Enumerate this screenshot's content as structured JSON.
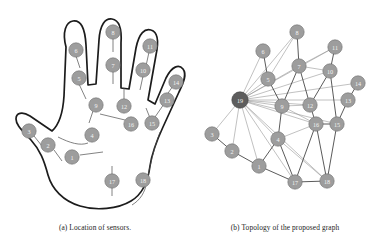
{
  "figure": {
    "background_color": "#ffffff",
    "node_color": "#9d9d9d",
    "hub_color": "#5d5d5d",
    "edge_color": "#8e8e8e",
    "edge_strong_color": "#3c3c3c",
    "outline_color": "#1c1c1c"
  },
  "panel_a": {
    "caption": "(a) Location of sensors.",
    "node_labels": {
      "n1": "1",
      "n2": "2",
      "n3": "3",
      "n4": "4",
      "n5": "5",
      "n6": "6",
      "n7": "7",
      "n8": "8",
      "n9": "9",
      "n10": "10",
      "n11": "11",
      "n12": "12",
      "n13": "13",
      "n14": "14",
      "n15": "15",
      "n16": "16",
      "n17": "17",
      "n18": "18"
    },
    "nodes": [
      {
        "id": "1",
        "label": "1",
        "x": 72,
        "y": 157
      },
      {
        "id": "2",
        "label": "2",
        "x": 48,
        "y": 145
      },
      {
        "id": "3",
        "label": "3",
        "x": 29,
        "y": 131
      },
      {
        "id": "4",
        "label": "4",
        "x": 92,
        "y": 135
      },
      {
        "id": "5",
        "label": "5",
        "x": 79,
        "y": 78
      },
      {
        "id": "6",
        "label": "6",
        "x": 76,
        "y": 50
      },
      {
        "id": "7",
        "label": "7",
        "x": 113,
        "y": 65
      },
      {
        "id": "8",
        "label": "8",
        "x": 113,
        "y": 32
      },
      {
        "id": "9",
        "label": "9",
        "x": 96,
        "y": 105
      },
      {
        "id": "10",
        "label": "10",
        "x": 143,
        "y": 70
      },
      {
        "id": "11",
        "label": "11",
        "x": 150,
        "y": 46
      },
      {
        "id": "12",
        "label": "12",
        "x": 124,
        "y": 106
      },
      {
        "id": "13",
        "label": "13",
        "x": 167,
        "y": 100
      },
      {
        "id": "14",
        "label": "14",
        "x": 176,
        "y": 82
      },
      {
        "id": "15",
        "label": "15",
        "x": 152,
        "y": 123
      },
      {
        "id": "16",
        "label": "16",
        "x": 131,
        "y": 124
      },
      {
        "id": "17",
        "label": "17",
        "x": 112,
        "y": 181
      },
      {
        "id": "18",
        "label": "18",
        "x": 143,
        "y": 180
      }
    ]
  },
  "panel_b": {
    "caption": "(b) Topology of the proposed graph",
    "hub_id": "19",
    "node_labels": {
      "n1": "1",
      "n2": "2",
      "n3": "3",
      "n4": "4",
      "n5": "5",
      "n6": "6",
      "n7": "7",
      "n8": "8",
      "n9": "9",
      "n10": "10",
      "n11": "11",
      "n12": "12",
      "n13": "13",
      "n14": "14",
      "n15": "15",
      "n16": "16",
      "n17": "17",
      "n18": "18",
      "n19": "19"
    },
    "nodes": [
      {
        "id": "19",
        "label": "19",
        "x": 240,
        "y": 100,
        "hub": true
      },
      {
        "id": "1",
        "label": "1",
        "x": 259,
        "y": 166
      },
      {
        "id": "2",
        "label": "2",
        "x": 232,
        "y": 151
      },
      {
        "id": "3",
        "label": "3",
        "x": 212,
        "y": 134
      },
      {
        "id": "4",
        "label": "4",
        "x": 278,
        "y": 139
      },
      {
        "id": "5",
        "label": "5",
        "x": 268,
        "y": 79
      },
      {
        "id": "6",
        "label": "6",
        "x": 263,
        "y": 51
      },
      {
        "id": "7",
        "label": "7",
        "x": 299,
        "y": 66
      },
      {
        "id": "8",
        "label": "8",
        "x": 297,
        "y": 32
      },
      {
        "id": "9",
        "label": "9",
        "x": 282,
        "y": 106
      },
      {
        "id": "10",
        "label": "10",
        "x": 330,
        "y": 71
      },
      {
        "id": "11",
        "label": "11",
        "x": 335,
        "y": 47
      },
      {
        "id": "12",
        "label": "12",
        "x": 310,
        "y": 105
      },
      {
        "id": "13",
        "label": "13",
        "x": 348,
        "y": 100
      },
      {
        "id": "14",
        "label": "14",
        "x": 358,
        "y": 83
      },
      {
        "id": "15",
        "label": "15",
        "x": 337,
        "y": 124
      },
      {
        "id": "16",
        "label": "16",
        "x": 316,
        "y": 124
      },
      {
        "id": "17",
        "label": "17",
        "x": 295,
        "y": 182
      },
      {
        "id": "18",
        "label": "18",
        "x": 327,
        "y": 181
      }
    ],
    "edges": [
      {
        "from": "19",
        "to": "1",
        "strong": false
      },
      {
        "from": "19",
        "to": "2",
        "strong": false
      },
      {
        "from": "19",
        "to": "3",
        "strong": false
      },
      {
        "from": "19",
        "to": "4",
        "strong": false
      },
      {
        "from": "19",
        "to": "5",
        "strong": false
      },
      {
        "from": "19",
        "to": "6",
        "strong": false
      },
      {
        "from": "19",
        "to": "7",
        "strong": false
      },
      {
        "from": "19",
        "to": "8",
        "strong": false
      },
      {
        "from": "19",
        "to": "9",
        "strong": false
      },
      {
        "from": "19",
        "to": "10",
        "strong": false
      },
      {
        "from": "19",
        "to": "11",
        "strong": false
      },
      {
        "from": "19",
        "to": "12",
        "strong": false
      },
      {
        "from": "19",
        "to": "13",
        "strong": false
      },
      {
        "from": "19",
        "to": "14",
        "strong": false
      },
      {
        "from": "19",
        "to": "15",
        "strong": false
      },
      {
        "from": "19",
        "to": "16",
        "strong": false
      },
      {
        "from": "19",
        "to": "17",
        "strong": false
      },
      {
        "from": "19",
        "to": "18",
        "strong": false
      },
      {
        "from": "3",
        "to": "2",
        "strong": true
      },
      {
        "from": "2",
        "to": "1",
        "strong": true
      },
      {
        "from": "1",
        "to": "4",
        "strong": true
      },
      {
        "from": "1",
        "to": "17",
        "strong": true
      },
      {
        "from": "4",
        "to": "9",
        "strong": true
      },
      {
        "from": "4",
        "to": "17",
        "strong": true
      },
      {
        "from": "4",
        "to": "16",
        "strong": false
      },
      {
        "from": "4",
        "to": "18",
        "strong": false
      },
      {
        "from": "9",
        "to": "5",
        "strong": true
      },
      {
        "from": "9",
        "to": "7",
        "strong": true
      },
      {
        "from": "9",
        "to": "12",
        "strong": false
      },
      {
        "from": "9",
        "to": "16",
        "strong": false
      },
      {
        "from": "5",
        "to": "6",
        "strong": true
      },
      {
        "from": "5",
        "to": "8",
        "strong": false
      },
      {
        "from": "7",
        "to": "8",
        "strong": true
      },
      {
        "from": "7",
        "to": "11",
        "strong": false
      },
      {
        "from": "7",
        "to": "12",
        "strong": true
      },
      {
        "from": "7",
        "to": "10",
        "strong": false
      },
      {
        "from": "10",
        "to": "11",
        "strong": true
      },
      {
        "from": "10",
        "to": "12",
        "strong": true
      },
      {
        "from": "10",
        "to": "15",
        "strong": true
      },
      {
        "from": "12",
        "to": "16",
        "strong": true
      },
      {
        "from": "13",
        "to": "14",
        "strong": true
      },
      {
        "from": "13",
        "to": "15",
        "strong": true
      },
      {
        "from": "15",
        "to": "16",
        "strong": true
      },
      {
        "from": "15",
        "to": "18",
        "strong": true
      },
      {
        "from": "16",
        "to": "17",
        "strong": true
      },
      {
        "from": "16",
        "to": "18",
        "strong": true
      },
      {
        "from": "17",
        "to": "18",
        "strong": true
      }
    ]
  }
}
